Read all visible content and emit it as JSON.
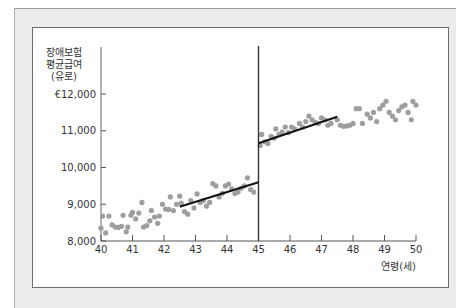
{
  "chart_data": {
    "type": "scatter",
    "title": "",
    "ylabel_lines": [
      "장애보험",
      "평균급여",
      "(유로)"
    ],
    "xlabel": "연령(세)",
    "xlim": [
      40,
      50
    ],
    "ylim": [
      8000,
      12000
    ],
    "x_ticks": [
      40,
      41,
      42,
      43,
      44,
      45,
      46,
      47,
      48,
      49,
      50
    ],
    "x_tick_labels": [
      "40",
      "41",
      "42",
      "43",
      "44",
      "45",
      "46",
      "47",
      "48",
      "49",
      "50"
    ],
    "y_ticks": [
      8000,
      9000,
      10000,
      11000,
      12000
    ],
    "y_tick_labels": [
      "8,000",
      "9,000",
      "10,000",
      "11,000",
      "€12,000"
    ],
    "grid": false,
    "cutoff_line": {
      "x": 45,
      "y_top": 12500
    },
    "fit_lines": [
      {
        "name": "below-45",
        "x": [
          42.5,
          45.0
        ],
        "y": [
          8930,
          9600
        ]
      },
      {
        "name": "above-45",
        "x": [
          45.0,
          47.5
        ],
        "y": [
          10660,
          11380
        ]
      }
    ],
    "series": [
      {
        "name": "observations",
        "color": "#9e9e9e",
        "points": [
          [
            40.0,
            8350
          ],
          [
            40.05,
            8680
          ],
          [
            40.15,
            8220
          ],
          [
            40.25,
            8680
          ],
          [
            40.35,
            8440
          ],
          [
            40.45,
            8380
          ],
          [
            40.55,
            8370
          ],
          [
            40.65,
            8400
          ],
          [
            40.7,
            8700
          ],
          [
            40.8,
            8250
          ],
          [
            40.85,
            8380
          ],
          [
            40.95,
            8700
          ],
          [
            41.0,
            8780
          ],
          [
            41.1,
            8600
          ],
          [
            41.2,
            8760
          ],
          [
            41.3,
            9050
          ],
          [
            41.35,
            8380
          ],
          [
            41.45,
            8420
          ],
          [
            41.55,
            8550
          ],
          [
            41.6,
            8830
          ],
          [
            41.7,
            8650
          ],
          [
            41.8,
            8480
          ],
          [
            41.85,
            8680
          ],
          [
            41.95,
            9000
          ],
          [
            42.05,
            8870
          ],
          [
            42.15,
            8860
          ],
          [
            42.2,
            9200
          ],
          [
            42.3,
            8830
          ],
          [
            42.4,
            9000
          ],
          [
            42.5,
            9220
          ],
          [
            42.55,
            9030
          ],
          [
            42.65,
            8800
          ],
          [
            42.75,
            8730
          ],
          [
            42.85,
            9100
          ],
          [
            42.95,
            8900
          ],
          [
            43.05,
            9280
          ],
          [
            43.15,
            9050
          ],
          [
            43.25,
            9100
          ],
          [
            43.35,
            8950
          ],
          [
            43.45,
            9050
          ],
          [
            43.55,
            9560
          ],
          [
            43.65,
            9500
          ],
          [
            43.75,
            9200
          ],
          [
            43.85,
            9300
          ],
          [
            43.95,
            9500
          ],
          [
            44.05,
            9550
          ],
          [
            44.15,
            9420
          ],
          [
            44.25,
            9290
          ],
          [
            44.35,
            9330
          ],
          [
            44.45,
            9440
          ],
          [
            44.55,
            9500
          ],
          [
            44.65,
            9720
          ],
          [
            44.75,
            9400
          ],
          [
            44.85,
            9330
          ],
          [
            45.05,
            10600
          ],
          [
            45.1,
            10900
          ],
          [
            45.2,
            10700
          ],
          [
            45.3,
            10650
          ],
          [
            45.4,
            10850
          ],
          [
            45.5,
            10800
          ],
          [
            45.55,
            11050
          ],
          [
            45.65,
            10900
          ],
          [
            45.75,
            10960
          ],
          [
            45.85,
            11100
          ],
          [
            45.95,
            10950
          ],
          [
            46.05,
            11100
          ],
          [
            46.15,
            11050
          ],
          [
            46.3,
            11200
          ],
          [
            46.4,
            11100
          ],
          [
            46.5,
            11250
          ],
          [
            46.6,
            11400
          ],
          [
            46.7,
            11300
          ],
          [
            46.8,
            11230
          ],
          [
            46.9,
            11200
          ],
          [
            47.0,
            11350
          ],
          [
            47.1,
            11300
          ],
          [
            47.2,
            11150
          ],
          [
            47.3,
            11200
          ],
          [
            47.5,
            11300
          ],
          [
            47.6,
            11150
          ],
          [
            47.7,
            11120
          ],
          [
            47.8,
            11130
          ],
          [
            47.9,
            11150
          ],
          [
            48.0,
            11200
          ],
          [
            48.1,
            11600
          ],
          [
            48.2,
            11600
          ],
          [
            48.3,
            11200
          ],
          [
            48.45,
            11450
          ],
          [
            48.55,
            11350
          ],
          [
            48.65,
            11500
          ],
          [
            48.75,
            11250
          ],
          [
            48.85,
            11600
          ],
          [
            48.95,
            11700
          ],
          [
            49.05,
            11800
          ],
          [
            49.15,
            11500
          ],
          [
            49.25,
            11400
          ],
          [
            49.35,
            11300
          ],
          [
            49.45,
            11550
          ],
          [
            49.55,
            11650
          ],
          [
            49.65,
            11700
          ],
          [
            49.75,
            11500
          ],
          [
            49.85,
            11300
          ],
          [
            49.9,
            11800
          ],
          [
            50.0,
            11700
          ]
        ]
      }
    ]
  },
  "plot_geometry": {
    "x0": 101,
    "x_per_unit": 31.5,
    "y0": 241,
    "y_per_1000": 36.75,
    "axis_top": 47
  }
}
